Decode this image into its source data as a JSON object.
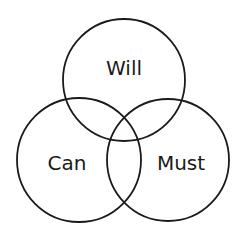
{
  "diagram": {
    "type": "venn",
    "sets": [
      {
        "id": "will",
        "label": "Will",
        "cx": 124,
        "cy": 80,
        "r": 61,
        "label_x": 124,
        "label_y": 75
      },
      {
        "id": "can",
        "label": "Can",
        "cx": 79,
        "cy": 160,
        "r": 62,
        "label_x": 67,
        "label_y": 170
      },
      {
        "id": "must",
        "label": "Must",
        "cx": 168,
        "cy": 160,
        "r": 61,
        "label_x": 181,
        "label_y": 170
      }
    ],
    "stroke_color": "#1a1a1a",
    "background_color": "#ffffff"
  }
}
